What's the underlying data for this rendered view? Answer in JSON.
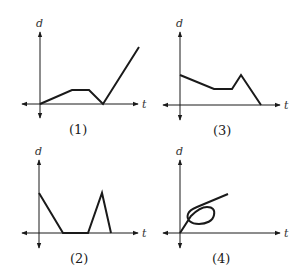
{
  "panels": [
    {
      "id": "1",
      "label": "(1)",
      "y_axis_label": "d",
      "x_axis_label": "t",
      "description": "Rises slowly, stays constant, returns to zero, then rises steeply",
      "points": [
        [
          0,
          0
        ],
        [
          0.32,
          0.22
        ],
        [
          0.5,
          0.22
        ],
        [
          0.63,
          0
        ],
        [
          1.0,
          0.9
        ]
      ]
    },
    {
      "id": "3",
      "label": "(3)",
      "y_axis_label": "d",
      "x_axis_label": "t",
      "description": "Starts positive, decreases, constant, rises to peak, drops to zero",
      "points": [
        [
          0,
          0.5
        ],
        [
          0.34,
          0.27
        ],
        [
          0.52,
          0.27
        ],
        [
          0.61,
          0.5
        ],
        [
          0.81,
          0
        ]
      ]
    },
    {
      "id": "2",
      "label": "(2)",
      "y_axis_label": "d",
      "x_axis_label": "t",
      "description": "Starts positive, drops to zero, stays zero, rises to peak, drops to zero",
      "points": [
        [
          0,
          0.66
        ],
        [
          0.24,
          0
        ],
        [
          0.49,
          0
        ],
        [
          0.63,
          0.66
        ],
        [
          0.72,
          0
        ]
      ]
    },
    {
      "id": "4",
      "label": "(4)",
      "y_axis_label": "d",
      "x_axis_label": "t",
      "description": "Rises from origin, forms a loop, then continues rising",
      "points": []
    }
  ]
}
